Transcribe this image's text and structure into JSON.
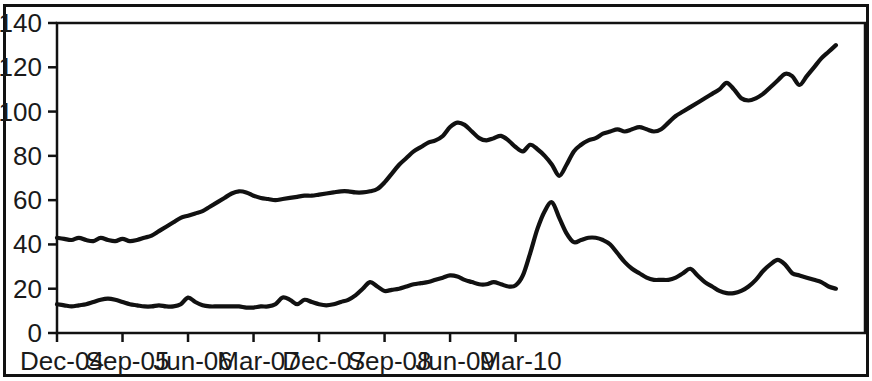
{
  "chart_data": {
    "type": "line",
    "title": "",
    "subtitle": "",
    "xlabel": "",
    "ylabel": "",
    "ylim": [
      0,
      140
    ],
    "y_ticks": [
      0,
      20,
      40,
      60,
      80,
      100,
      120,
      140
    ],
    "x_tick_labels": [
      "Dec-04",
      "Sep-05",
      "Jun-06",
      "Mar-07",
      "Dec-07",
      "Sep-08",
      "Jun-09",
      "Mar-10"
    ],
    "x_tick_interval_months": 9,
    "x_start": "Dec-04",
    "x_end": "Dec-10",
    "grid": false,
    "legend": "none",
    "line_color": "#111111",
    "background_color": "#ffffff",
    "series": [
      {
        "name": "upper-series",
        "values": [
          43,
          42.5,
          42,
          43,
          42,
          41.5,
          43,
          42,
          41.5,
          42.5,
          41.5,
          42,
          43,
          44,
          46,
          48,
          50,
          52,
          53,
          54,
          55,
          57,
          59,
          61,
          63,
          64,
          63.5,
          62,
          61,
          60.5,
          60,
          60.5,
          61,
          61.5,
          62,
          62,
          62.5,
          63,
          63.5,
          64,
          64,
          63.5,
          63.5,
          64,
          65,
          68,
          72,
          76,
          79,
          82,
          84,
          86,
          87,
          89,
          93,
          95,
          94,
          91,
          88,
          87,
          88,
          89,
          87,
          84,
          82,
          85,
          83,
          80,
          76,
          71,
          76,
          82,
          85,
          87,
          88,
          90,
          91,
          92,
          91,
          92,
          93,
          92,
          91,
          92,
          95,
          98,
          100,
          102,
          104,
          106,
          108,
          110,
          113,
          110,
          106,
          105,
          106,
          108,
          111,
          114,
          117,
          116,
          112,
          116,
          120,
          124,
          127,
          130
        ]
      },
      {
        "name": "lower-series",
        "values": [
          13,
          12.5,
          12,
          12.5,
          13,
          14,
          15,
          15.5,
          15,
          14,
          13,
          12.5,
          12,
          12,
          12.5,
          12,
          12,
          13,
          16,
          14,
          12.5,
          12,
          12,
          12,
          12,
          12,
          11.5,
          11.5,
          12,
          12,
          13,
          16,
          15,
          13,
          15,
          14,
          13,
          12.5,
          13,
          14,
          15,
          17,
          20,
          23,
          21,
          19,
          19.5,
          20,
          21,
          22,
          22.5,
          23,
          24,
          25,
          26,
          25.5,
          24,
          23,
          22,
          22,
          23,
          22,
          21,
          21.5,
          26,
          36,
          47,
          55,
          59,
          52,
          45,
          41,
          42,
          43,
          43,
          42,
          40,
          36,
          32,
          29,
          27,
          25,
          24,
          24,
          24,
          25,
          27,
          29,
          26,
          23,
          21,
          19,
          18,
          18,
          19,
          21,
          24,
          28,
          31,
          33,
          31,
          27,
          26,
          25,
          24,
          23,
          21,
          20
        ]
      }
    ]
  }
}
